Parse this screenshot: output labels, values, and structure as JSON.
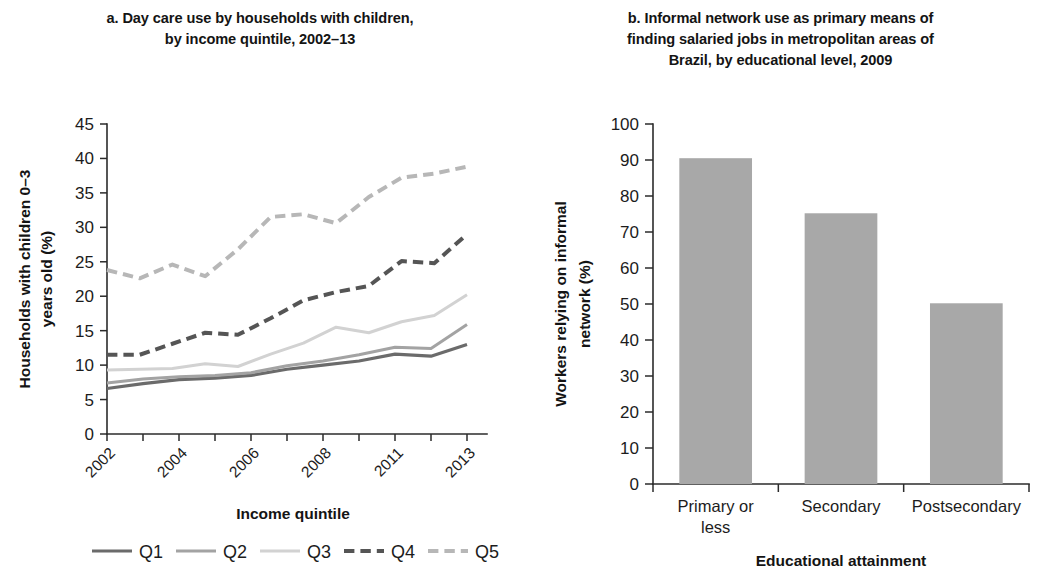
{
  "figure": {
    "background": "#ffffff"
  },
  "panel_a": {
    "title": "a. Day care use by households with children,\nby income quintile, 2002–13",
    "ylabel": "Households with children 0–3\nyears old (%)",
    "xlabel": "Income quintile",
    "legend": [
      "Q1",
      "Q2",
      "Q3",
      "Q4",
      "Q5"
    ]
  },
  "panel_b": {
    "title": "b. Informal network use as primary means of\nfinding salaried jobs in metropolitan areas of\nBrazil, by educational level, 2009",
    "ylabel": "Workers relying on informal\nnetwork (%)",
    "xlabel": "Educational attainment"
  },
  "chart_data": [
    {
      "type": "line",
      "panel": "a",
      "title": "a. Day care use by households with children, by income quintile, 2002–13",
      "xlabel": "Income quintile",
      "ylabel": "Households with children 0–3 years old (%)",
      "ylim": [
        0,
        45
      ],
      "yticks": [
        0,
        5,
        10,
        15,
        20,
        25,
        30,
        35,
        40,
        45
      ],
      "grid": false,
      "legend_position": "bottom",
      "x": [
        "2002",
        "2003",
        "2004",
        "2005",
        "2006",
        "2007",
        "2008",
        "2009",
        "2011",
        "2012",
        "2013"
      ],
      "xtick_labels": [
        "2002",
        "",
        "2004",
        "",
        "2006",
        "",
        "2008",
        "",
        "2011",
        "",
        "2013"
      ],
      "series": [
        {
          "name": "Q1",
          "style": "solid",
          "color": "#6b6b6b",
          "width": 3.2,
          "values": [
            6.6,
            7.3,
            7.9,
            8.1,
            8.5,
            9.4,
            10.0,
            10.6,
            11.6,
            11.3,
            13.0
          ]
        },
        {
          "name": "Q2",
          "style": "solid",
          "color": "#a3a3a3",
          "width": 3.0,
          "values": [
            7.4,
            8.0,
            8.3,
            8.5,
            8.9,
            9.9,
            10.6,
            11.5,
            12.6,
            12.4,
            15.9
          ]
        },
        {
          "name": "Q3",
          "style": "solid",
          "color": "#d2d2d2",
          "width": 3.0,
          "values": [
            9.3,
            9.4,
            9.5,
            10.2,
            9.8,
            11.6,
            13.2,
            15.5,
            14.7,
            16.3,
            17.2,
            20.2
          ]
        },
        {
          "name": "Q4",
          "style": "dashed",
          "color": "#555555",
          "width": 4.0,
          "values": [
            11.5,
            11.5,
            13.1,
            14.7,
            14.4,
            16.8,
            19.4,
            20.6,
            21.5,
            25.1,
            24.8,
            29.0
          ]
        },
        {
          "name": "Q5",
          "style": "dashed",
          "color": "#b7b7b7",
          "width": 4.0,
          "values": [
            23.8,
            22.6,
            24.6,
            22.9,
            26.8,
            31.5,
            31.9,
            30.6,
            34.4,
            37.2,
            37.8,
            38.8
          ]
        }
      ]
    },
    {
      "type": "bar",
      "panel": "b",
      "title": "b. Informal network use as primary means of finding salaried jobs in metropolitan areas of Brazil, by educational level, 2009",
      "xlabel": "Educational attainment",
      "ylabel": "Workers relying on informal network (%)",
      "ylim": [
        0,
        100
      ],
      "yticks": [
        0,
        10,
        20,
        30,
        40,
        50,
        60,
        70,
        80,
        90,
        100
      ],
      "grid": false,
      "bar_color": "#a8a8a8",
      "categories": [
        "Primary or\nless",
        "Secondary",
        "Postsecondary"
      ],
      "values": [
        90.5,
        75.2,
        50.2
      ]
    }
  ]
}
